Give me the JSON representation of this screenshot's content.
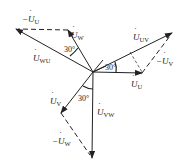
{
  "diagram": {
    "type": "phasor",
    "origin": [
      93,
      72
    ],
    "colors": {
      "line": "#222222",
      "background": "#ffffff"
    },
    "phasors": [
      {
        "id": "U",
        "label_prefix": "",
        "label_main": "U",
        "label_sub": "U",
        "tip": [
          142,
          73
        ],
        "style": "solid"
      },
      {
        "id": "V",
        "label_prefix": "",
        "label_main": "U",
        "label_sub": "V",
        "tip": [
          61,
          113
        ],
        "style": "solid"
      },
      {
        "id": "W",
        "label_prefix": "",
        "label_main": "U",
        "label_sub": "W",
        "tip": [
          68,
          30
        ],
        "style": "solid"
      },
      {
        "id": "UV",
        "label_prefix": "",
        "label_main": "U",
        "label_sub": "UV",
        "tip": [
          172,
          33
        ],
        "style": "solid"
      },
      {
        "id": "VW",
        "label_prefix": "",
        "label_main": "U",
        "label_sub": "VW",
        "tip": [
          92,
          158
        ],
        "style": "solid"
      },
      {
        "id": "WU",
        "label_prefix": "",
        "label_main": "U",
        "label_sub": "WU",
        "tip": [
          16,
          29
        ],
        "style": "solid"
      },
      {
        "id": "negU",
        "label_prefix": "−",
        "label_main": "U",
        "label_sub": "U",
        "from": [
          68,
          30
        ],
        "to": [
          16,
          29
        ],
        "style": "dashed"
      },
      {
        "id": "negV",
        "label_prefix": "−",
        "label_main": "U",
        "label_sub": "V",
        "from": [
          142,
          73
        ],
        "to": [
          172,
          33
        ],
        "style": "dashed"
      },
      {
        "id": "negW",
        "label_prefix": "−",
        "label_main": "U",
        "label_sub": "W",
        "from": [
          61,
          113
        ],
        "to": [
          92,
          158
        ],
        "style": "dashed"
      }
    ],
    "angles": [
      {
        "label": "30°",
        "between": [
          "WU",
          "W"
        ]
      },
      {
        "label": "30°",
        "between": [
          "UV",
          "U"
        ]
      },
      {
        "label": "30°",
        "between": [
          "V",
          "VW"
        ]
      }
    ]
  }
}
